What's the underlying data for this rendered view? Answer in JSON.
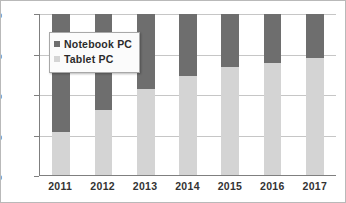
{
  "chart_data": {
    "type": "bar",
    "subtype": "100% stacked column",
    "title": "",
    "xlabel": "",
    "ylabel": "",
    "categories": [
      "2011",
      "2012",
      "2013",
      "2014",
      "2015",
      "2016",
      "2017"
    ],
    "series": [
      {
        "name": "Tablet PC",
        "color": "#d4d4d4",
        "values": [
          27,
          41,
          54,
          62,
          67,
          70,
          73
        ]
      },
      {
        "name": "Notebook PC",
        "color": "#6e6e6e",
        "values": [
          73,
          59,
          46,
          38,
          33,
          30,
          27
        ]
      }
    ],
    "ylim": [
      0,
      100
    ],
    "yticks": [
      0,
      25,
      50,
      75,
      100
    ],
    "ytick_labels": [
      "0%",
      "25%",
      "50%",
      "75%",
      "100%"
    ],
    "grid": true,
    "legend_position": "upper-left-inside"
  },
  "legend": {
    "items": [
      {
        "label": "Notebook PC",
        "swatch": "#6e6e6e"
      },
      {
        "label": "Tablet PC",
        "swatch": "#d4d4d4"
      }
    ]
  }
}
